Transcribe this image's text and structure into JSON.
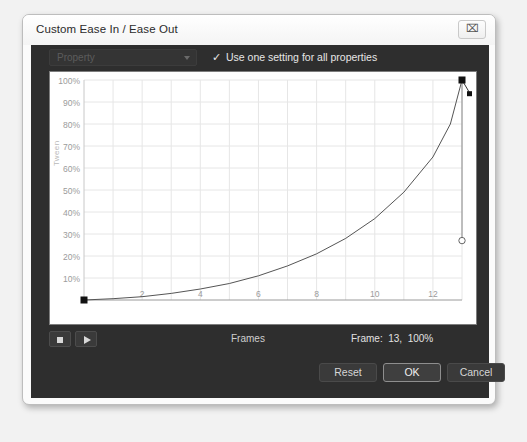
{
  "window": {
    "title": "Custom Ease In / Ease Out",
    "close_icon": "close-icon",
    "close_glyph": "⌧"
  },
  "options": {
    "property_label": "Property",
    "property_caret_icon": "chevron-down-icon",
    "use_one_setting_label": "Use one setting for all properties",
    "use_one_setting_checked": true,
    "check_glyph": "✓"
  },
  "graph": {
    "y_axis_title": "Tween",
    "x_axis_title": "Frames"
  },
  "transport": {
    "stop_icon": "stop-icon",
    "play_icon": "play-icon",
    "frames_label": "Frames",
    "frame_status": "Frame:  13,  100%"
  },
  "buttons": {
    "reset": "Reset",
    "ok": "OK",
    "cancel": "Cancel"
  },
  "colors": {
    "dialog_body": "#2e2e2e",
    "graph_background": "#ffffff",
    "grid_line": "#e6e6e6",
    "curve": "#555555",
    "anchor_point": "#111111",
    "control_point_outline": "#666666"
  },
  "chart_data": {
    "type": "line",
    "title": "",
    "xlabel": "Frames",
    "ylabel": "Tween",
    "xlim": [
      0,
      13
    ],
    "ylim": [
      0,
      100
    ],
    "grid": true,
    "legend": null,
    "xticks": [
      2,
      4,
      6,
      8,
      10,
      12
    ],
    "xtick_labels": [
      "2",
      "4",
      "6",
      "8",
      "10",
      "12"
    ],
    "yticks": [
      10,
      20,
      30,
      40,
      50,
      60,
      70,
      80,
      90,
      100
    ],
    "ytick_labels": [
      "10%",
      "20%",
      "30%",
      "40%",
      "50%",
      "60%",
      "70%",
      "80%",
      "90%",
      "100%"
    ],
    "series": [
      {
        "name": "Ease In curve",
        "x": [
          0,
          1,
          2,
          3,
          4,
          5,
          6,
          7,
          8,
          9,
          10,
          11,
          12,
          12.6,
          13
        ],
        "values": [
          0,
          0.6,
          1.5,
          3,
          5,
          7.5,
          11,
          15.5,
          21,
          28,
          37,
          49,
          65,
          80,
          100
        ]
      }
    ],
    "control_points": [
      {
        "name": "start-anchor",
        "x": 0,
        "y": 0,
        "style": "filled-square",
        "selected": false
      },
      {
        "name": "end-anchor",
        "x": 13,
        "y": 100,
        "style": "filled-square",
        "selected": true
      },
      {
        "name": "tangent-handle",
        "x": 13,
        "y": 94,
        "style": "filled-square-small",
        "selected": false
      },
      {
        "name": "lower-control-point",
        "x": 13,
        "y": 27,
        "style": "hollow-circle",
        "selected": false
      }
    ]
  }
}
